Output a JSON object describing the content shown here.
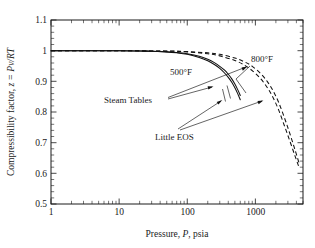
{
  "chart_data": {
    "type": "line",
    "title": "",
    "xlabel": "Pressure, P, psia",
    "ylabel": "Compressibility factor, z = Pv/RT",
    "xscale": "log",
    "xlim": [
      1,
      5000
    ],
    "ylim": [
      0.5,
      1.1
    ],
    "grid": false,
    "legend": "none",
    "xticks": [
      1,
      10,
      100,
      1000
    ],
    "xticklabels": [
      "1",
      "10",
      "100",
      "1000"
    ],
    "yticks": [
      0.5,
      0.6,
      0.7,
      0.8,
      0.9,
      1.0,
      1.1
    ],
    "yticklabels": [
      "0.5",
      "0.6",
      "0.7",
      "0.8",
      "0.9",
      "1",
      "1.1"
    ],
    "annotations": [
      {
        "name": "temp-500",
        "text": "500°F"
      },
      {
        "name": "temp-800",
        "text": "800°F"
      },
      {
        "name": "steam-tables",
        "text": "Steam Tables"
      },
      {
        "name": "little-eos",
        "text": "Little EOS"
      }
    ],
    "series": [
      {
        "name": "Steam Tables 500°F",
        "style": "solid",
        "temperature": "500°F",
        "x": [
          1,
          3,
          10,
          20,
          30,
          50,
          70,
          100,
          150,
          200,
          250,
          300,
          350,
          400,
          450,
          500,
          550,
          600
        ],
        "y": [
          1.0,
          1.0,
          1.0,
          0.999,
          0.998,
          0.996,
          0.993,
          0.988,
          0.978,
          0.967,
          0.955,
          0.942,
          0.928,
          0.913,
          0.897,
          0.879,
          0.86,
          0.84
        ]
      },
      {
        "name": "Little EOS 500°F",
        "style": "solid",
        "temperature": "500°F",
        "x": [
          1,
          3,
          10,
          20,
          30,
          50,
          70,
          100,
          150,
          200,
          250,
          300,
          350,
          400,
          450,
          500,
          550,
          600
        ],
        "y": [
          1.0,
          1.0,
          1.0,
          0.999,
          0.998,
          0.996,
          0.994,
          0.99,
          0.982,
          0.972,
          0.961,
          0.949,
          0.937,
          0.923,
          0.908,
          0.891,
          0.873,
          0.854
        ]
      },
      {
        "name": "Steam Tables 800°F",
        "style": "dashed",
        "temperature": "800°F",
        "x": [
          1,
          3,
          10,
          30,
          60,
          100,
          200,
          300,
          500,
          700,
          900,
          1200,
          1500,
          1800,
          2200,
          2700,
          3200,
          3800,
          4400
        ],
        "y": [
          1.0,
          1.0,
          1.0,
          0.999,
          0.998,
          0.996,
          0.99,
          0.983,
          0.968,
          0.952,
          0.935,
          0.908,
          0.879,
          0.849,
          0.806,
          0.752,
          0.706,
          0.658,
          0.618
        ]
      },
      {
        "name": "Little EOS 800°F",
        "style": "dashed",
        "temperature": "800°F",
        "x": [
          1,
          3,
          10,
          30,
          60,
          100,
          200,
          300,
          500,
          700,
          900,
          1200,
          1500,
          1800,
          2200,
          2700,
          3200,
          3800,
          4400
        ],
        "y": [
          1.0,
          1.0,
          1.0,
          0.999,
          0.999,
          0.997,
          0.993,
          0.988,
          0.976,
          0.963,
          0.949,
          0.925,
          0.899,
          0.871,
          0.831,
          0.778,
          0.73,
          0.678,
          0.632
        ]
      }
    ]
  },
  "labels": {
    "y_axis_prefix": "Compressibility factor, ",
    "y_axis_var": "z = Pv/RT",
    "x_axis_prefix": "Pressure, ",
    "x_axis_var": "P",
    "x_axis_suffix": ", psia",
    "tick_x_1": "1",
    "tick_x_10": "10",
    "tick_x_100": "100",
    "tick_x_1000": "1000",
    "tick_y_05": "0.5",
    "tick_y_06": "0.6",
    "tick_y_07": "0.7",
    "tick_y_08": "0.8",
    "tick_y_09": "0.9",
    "tick_y_10": "1",
    "tick_y_11": "1.1",
    "annot_500": "500°F",
    "annot_800": "800°F",
    "annot_steam": "Steam Tables",
    "annot_eos": "Little EOS"
  }
}
